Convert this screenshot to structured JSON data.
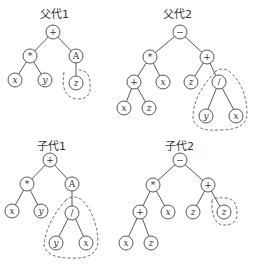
{
  "trees": [
    {
      "title": "父代1",
      "nodes": [
        "+",
        "*",
        "A",
        "x",
        "y",
        "z"
      ],
      "highlighted_subtree": "z"
    },
    {
      "title": "父代2",
      "nodes": [
        "−",
        "*",
        "+",
        "+",
        "x",
        "z",
        "/",
        "x",
        "z",
        "y",
        "x"
      ],
      "highlighted_subtree": "/(y, x)"
    },
    {
      "title": "子代1",
      "nodes": [
        "+",
        "*",
        "A",
        "x",
        "y",
        "/",
        "y",
        "x"
      ],
      "highlighted_subtree": "/(y, x)"
    },
    {
      "title": "子代2",
      "nodes": [
        "−",
        "*",
        "+",
        "+",
        "x",
        "z",
        "z",
        "x",
        "z"
      ],
      "highlighted_subtree": "z"
    }
  ],
  "labels": {
    "t1": {
      "title": "父代1",
      "root": "+",
      "n1": "*",
      "n2": "A",
      "n3": "x",
      "n4": "y",
      "n5": "z"
    },
    "t2": {
      "title": "父代2",
      "root": "−",
      "n1": "*",
      "n2": "+",
      "n3": "+",
      "n4": "x",
      "n5": "z",
      "n6": "/",
      "n7": "x",
      "n8": "z",
      "n9": "y",
      "n10": "x"
    },
    "t3": {
      "title": "子代1",
      "root": "+",
      "n1": "*",
      "n2": "A",
      "n3": "x",
      "n4": "y",
      "n5": "/",
      "n6": "y",
      "n7": "x"
    },
    "t4": {
      "title": "子代2",
      "root": "−",
      "n1": "*",
      "n2": "+",
      "n3": "+",
      "n4": "x",
      "n5": "z",
      "n6": "z",
      "n7": "x",
      "n8": "z"
    }
  }
}
